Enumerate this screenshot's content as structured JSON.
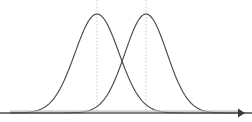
{
  "figure": {
    "title": "Two overlapping bell curves",
    "background_color": "#ffffff",
    "width": 252,
    "height": 122
  },
  "axis": {
    "name": "horizontal-axis",
    "label": "",
    "color": "#555555",
    "arrow_direction": "right",
    "start_x": 10,
    "end_x": 244,
    "y": 113
  },
  "curves": [
    {
      "name": "left-distribution",
      "label": "",
      "color": "#4a4a4a",
      "mean": 97,
      "peak_y": 14,
      "stddev": 22
    },
    {
      "name": "right-distribution",
      "label": "",
      "color": "#4a4a4a",
      "mean": 146,
      "peak_y": 14,
      "stddev": 21
    }
  ],
  "mean_lines": [
    {
      "name": "left-mean-line",
      "label": "",
      "x": 97,
      "color": "#cfcfcf",
      "style": "dashed"
    },
    {
      "name": "right-mean-line",
      "label": "",
      "x": 146,
      "color": "#cfcfcf",
      "style": "dashed"
    }
  ],
  "chart_data": {
    "type": "line",
    "title": "",
    "subtitle": "",
    "xlabel": "",
    "ylabel": "",
    "grid": false,
    "legend": "none",
    "xlim": [
      0,
      252
    ],
    "ylim": [
      0,
      1
    ],
    "annotations": [
      {
        "type": "vline",
        "x": 97,
        "style": "dashed",
        "color": "#cfcfcf",
        "label": ""
      },
      {
        "type": "vline",
        "x": 146,
        "style": "dashed",
        "color": "#cfcfcf",
        "label": ""
      },
      {
        "type": "arrow",
        "axis": "x",
        "direction": "right",
        "label": ""
      }
    ],
    "series": [
      {
        "name": "left-distribution",
        "color": "#4a4a4a",
        "distribution": "normal",
        "mean": 97,
        "stddev": 22,
        "amplitude": 1.0,
        "x": [
          10,
          20,
          30,
          40,
          50,
          55,
          60,
          65,
          70,
          75,
          80,
          85,
          90,
          97,
          104,
          109,
          114,
          119,
          124,
          129,
          134,
          139,
          144,
          154,
          164,
          174,
          184,
          194,
          204,
          214,
          230
        ],
        "values": [
          0.001,
          0.003,
          0.008,
          0.019,
          0.047,
          0.072,
          0.106,
          0.153,
          0.212,
          0.286,
          0.371,
          0.544,
          0.757,
          1.0,
          0.952,
          0.829,
          0.677,
          0.522,
          0.38,
          0.261,
          0.169,
          0.104,
          0.061,
          0.018,
          0.005,
          0.001,
          0.0,
          0.0,
          0.0,
          0.0,
          0.0
        ]
      },
      {
        "name": "right-distribution",
        "color": "#4a4a4a",
        "distribution": "normal",
        "mean": 146,
        "stddev": 21,
        "amplitude": 1.0,
        "x": [
          40,
          55,
          65,
          75,
          85,
          95,
          100,
          105,
          110,
          115,
          120,
          125,
          130,
          135,
          140,
          146,
          152,
          158,
          163,
          168,
          173,
          178,
          183,
          188,
          193,
          203,
          213,
          223,
          233,
          243
        ],
        "values": [
          0.0,
          0.0,
          0.0,
          0.001,
          0.003,
          0.011,
          0.02,
          0.035,
          0.059,
          0.096,
          0.149,
          0.222,
          0.37,
          0.577,
          0.806,
          1.0,
          0.951,
          0.824,
          0.69,
          0.544,
          0.403,
          0.281,
          0.184,
          0.113,
          0.065,
          0.018,
          0.005,
          0.001,
          0.0,
          0.0
        ]
      }
    ]
  }
}
